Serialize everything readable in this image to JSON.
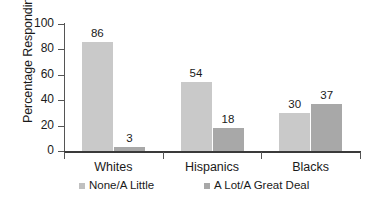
{
  "chart_data": {
    "type": "bar",
    "title": "",
    "xlabel": "",
    "ylabel": "Percentage Responding",
    "categories": [
      "Whites",
      "Hispanics",
      "Blacks"
    ],
    "series": [
      {
        "name": "None/A Little",
        "values": [
          86,
          54,
          30
        ],
        "color": "#c9c9c9"
      },
      {
        "name": "A Lot/A Great Deal",
        "values": [
          3,
          18,
          37
        ],
        "color": "#a8a8a8"
      }
    ],
    "ylim": [
      0,
      100
    ],
    "yticks": [
      0,
      20,
      40,
      60,
      80,
      100
    ],
    "ytick_labels": [
      "0",
      "20",
      "40",
      "60",
      "80",
      "100"
    ],
    "grid": false,
    "legend_position": "bottom",
    "data_labels": true
  },
  "legend": {
    "items": [
      {
        "label": "None/A Little"
      },
      {
        "label": "A Lot/A Great Deal"
      }
    ]
  }
}
